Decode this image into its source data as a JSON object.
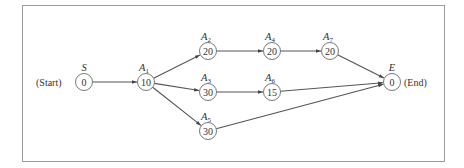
{
  "diagram": {
    "type": "activity-network",
    "nodes": [
      {
        "id": "S",
        "name": "S",
        "sub": "",
        "value": "0",
        "cx": 84,
        "cy": 82
      },
      {
        "id": "A1",
        "name": "A",
        "sub": "1",
        "value": "10",
        "cx": 146,
        "cy": 82
      },
      {
        "id": "A2",
        "name": "A",
        "sub": "2",
        "value": "20",
        "cx": 208,
        "cy": 51
      },
      {
        "id": "A3",
        "name": "A",
        "sub": "3",
        "value": "30",
        "cx": 208,
        "cy": 92
      },
      {
        "id": "A5",
        "name": "A",
        "sub": "5",
        "value": "30",
        "cx": 208,
        "cy": 131
      },
      {
        "id": "A4",
        "name": "A",
        "sub": "4",
        "value": "20",
        "cx": 272,
        "cy": 51
      },
      {
        "id": "A6",
        "name": "A",
        "sub": "6",
        "value": "15",
        "cx": 272,
        "cy": 92
      },
      {
        "id": "A7",
        "name": "A",
        "sub": "7",
        "value": "20",
        "cx": 330,
        "cy": 51
      },
      {
        "id": "E",
        "name": "E",
        "sub": "",
        "value": "0",
        "cx": 392,
        "cy": 82
      }
    ],
    "edges": [
      [
        "S",
        "A1"
      ],
      [
        "A1",
        "A2"
      ],
      [
        "A1",
        "A3"
      ],
      [
        "A1",
        "A5"
      ],
      [
        "A2",
        "A4"
      ],
      [
        "A4",
        "A7"
      ],
      [
        "A7",
        "E"
      ],
      [
        "A3",
        "A6"
      ],
      [
        "A6",
        "E"
      ],
      [
        "A5",
        "E"
      ]
    ],
    "start_label": "(Start)",
    "end_label": "(End)"
  }
}
